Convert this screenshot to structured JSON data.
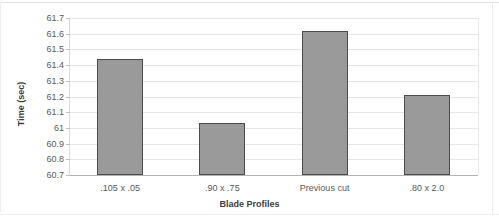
{
  "chart_data": {
    "type": "bar",
    "title": "",
    "subtitle": "",
    "xlabel": "Blade Profiles",
    "ylabel": "Time (sec)",
    "categories": [
      ".105 x .05",
      ".90 x .75",
      "Previous cut",
      ".80 x 2.0"
    ],
    "values": [
      61.44,
      61.03,
      61.62,
      61.21
    ],
    "ylim": [
      60.7,
      61.7
    ],
    "yticks": [
      60.7,
      60.8,
      60.9,
      61.0,
      61.1,
      61.2,
      61.3,
      61.4,
      61.5,
      61.6,
      61.7
    ],
    "ytick_labels": [
      "60.7",
      "60.8",
      "60.9",
      "61",
      "61.1",
      "61.2",
      "61.3",
      "61.4",
      "61.5",
      "61.6",
      "61.7"
    ],
    "grid": true,
    "grid_axis": "y",
    "legend": false,
    "bar_color": "#9a9a9a",
    "bar_edge_color": "#4a4a4a",
    "grid_color": "#e6e6e6",
    "axis_color": "#b3b3b3",
    "text_color": "#5a5a5a"
  }
}
